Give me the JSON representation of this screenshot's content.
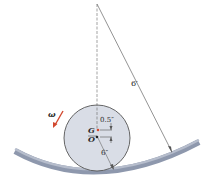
{
  "diagram": {
    "labels": {
      "omega": "ω",
      "G": "G",
      "O": "O",
      "offset": "0.5″",
      "wheel_radius": "6″",
      "track_radius": "6′"
    },
    "colors": {
      "wheel_fill": "#d9dde6",
      "track": "#8e98ad",
      "arrow": "#d2482f",
      "G_dot": "#d2482f",
      "lines": "#555555"
    }
  }
}
